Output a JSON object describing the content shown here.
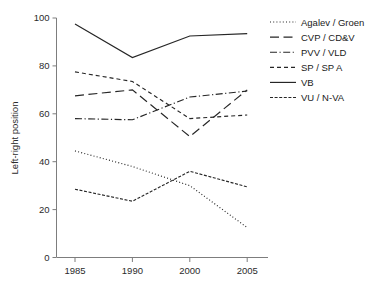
{
  "chart_data": {
    "type": "line",
    "title": "",
    "xlabel": "",
    "ylabel": "Left-right position",
    "x": [
      "1985",
      "1990",
      "2000",
      "2005"
    ],
    "xtick_labels": [
      "1985",
      "1990",
      "2000",
      "2005"
    ],
    "ytick_labels": [
      "0",
      "20",
      "40",
      "60",
      "80",
      "100"
    ],
    "ytick_values": [
      0,
      20,
      40,
      60,
      80,
      100
    ],
    "ylim": [
      0,
      100
    ],
    "grid": false,
    "legend_position": "right",
    "series": [
      {
        "name": "Agalev / Groen",
        "style": "dotted",
        "dash": "1,2.2",
        "values": [
          44.5,
          38.0,
          30.0,
          12.5
        ]
      },
      {
        "name": "CVP / CD&V",
        "style": "long-dash",
        "dash": "9,4.5",
        "values": [
          67.5,
          70.0,
          50.5,
          70.0
        ]
      },
      {
        "name": "PVV / VLD",
        "style": "dash-dot",
        "dash": "7,2.5,1.2,2.5",
        "values": [
          58.0,
          57.5,
          67.0,
          69.5
        ]
      },
      {
        "name": "SP / SP A",
        "style": "short-dash",
        "dash": "4,3",
        "values": [
          77.5,
          73.5,
          58.0,
          59.5
        ]
      },
      {
        "name": "VB",
        "style": "solid",
        "dash": "none",
        "values": [
          97.5,
          83.5,
          92.5,
          93.5
        ]
      },
      {
        "name": "VU / N-VA",
        "style": "dense-dash",
        "dash": "3,1.6",
        "values": [
          28.5,
          23.5,
          36.0,
          29.5
        ]
      }
    ]
  },
  "legend": {
    "items": [
      {
        "label": "Agalev / Groen"
      },
      {
        "label": "CVP / CD&V"
      },
      {
        "label": "PVV / VLD"
      },
      {
        "label": "SP / SP A"
      },
      {
        "label": "VB"
      },
      {
        "label": "VU / N-VA"
      }
    ]
  },
  "colors": {
    "ink": "#262626",
    "axis": "#7d7d7d",
    "background": "#ffffff"
  }
}
